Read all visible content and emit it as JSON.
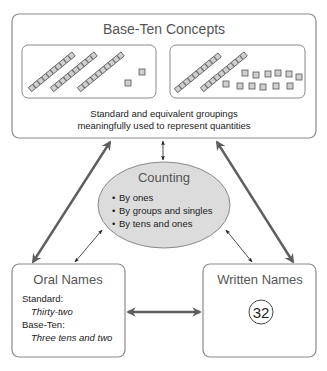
{
  "colors": {
    "box_stroke": "#8a8a8a",
    "thick_arrow": "#5e5e5e",
    "thin_arrow": "#222222",
    "ellipse_fill": "#dcdcdc",
    "ellipse_stroke": "#888888",
    "block_fill": "#cfcfcf",
    "block_stroke": "#555555",
    "title_text": "#555555"
  },
  "base_ten": {
    "title": "Base-Ten Concepts",
    "caption_line1": "Standard and equivalent groupings",
    "caption_line2": "meaningfully used to represent quantities",
    "left_model": {
      "tens_rods": 3,
      "ones": 2
    },
    "right_model": {
      "tens_rods": 2,
      "ones": 12
    }
  },
  "counting": {
    "title": "Counting",
    "items": [
      "By ones",
      "By groups and singles",
      "By tens and ones"
    ],
    "bullet": "•"
  },
  "oral_names": {
    "title": "Oral Names",
    "standard_label": "Standard:",
    "standard_value": "Thirty-two",
    "base_ten_label": "Base-Ten:",
    "base_ten_value": "Three tens and two"
  },
  "written_names": {
    "title": "Written Names",
    "numeral": "32"
  }
}
